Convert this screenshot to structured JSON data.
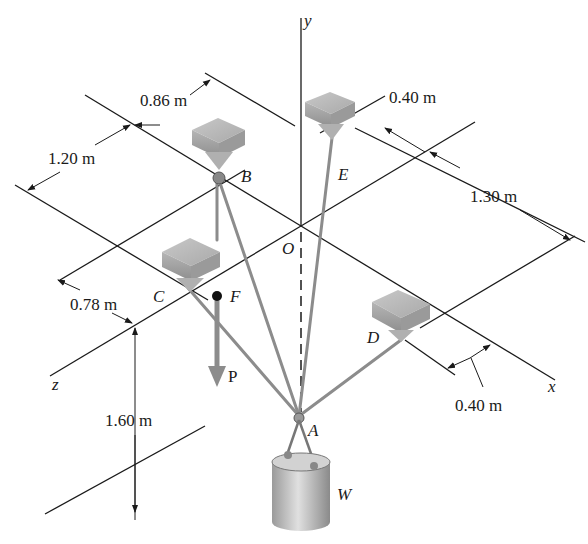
{
  "figure": {
    "axes": {
      "x": "x",
      "y": "y",
      "z": "z"
    },
    "points": {
      "O": "O",
      "A": "A",
      "B": "B",
      "C": "C",
      "D": "D",
      "E": "E",
      "F": "F"
    },
    "load": {
      "force": "P",
      "weight": "W"
    },
    "dimensions": {
      "d1": "0.86 m",
      "d2": "1.20 m",
      "d3": "0.40 m",
      "d4": "1.30 m",
      "d5": "0.78 m",
      "d6": "1.60 m",
      "d7": "0.40 m"
    }
  }
}
